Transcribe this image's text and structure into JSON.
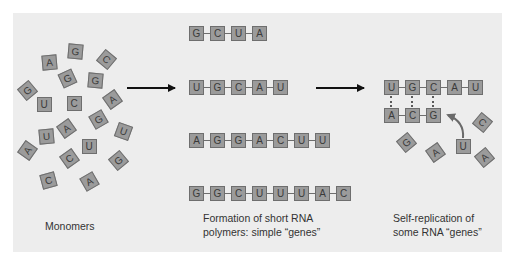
{
  "colors": {
    "panel_background": "#ededed",
    "tile_fill": "#9b9b9b",
    "tile_border": "#6e6e6e",
    "arrow": "#111111",
    "curved_arrow": "#6a6a6a",
    "caption_text": "#333333"
  },
  "sections": {
    "monomers": {
      "caption": "Monomers",
      "tiles": [
        {
          "letter": "A",
          "x": 49,
          "y": 62,
          "rot": -5
        },
        {
          "letter": "G",
          "x": 75,
          "y": 51,
          "rot": 5
        },
        {
          "letter": "C",
          "x": 106,
          "y": 59,
          "rot": 40
        },
        {
          "letter": "G",
          "x": 67,
          "y": 78,
          "rot": -25
        },
        {
          "letter": "G",
          "x": 95,
          "y": 80,
          "rot": 5
        },
        {
          "letter": "G",
          "x": 27,
          "y": 90,
          "rot": -40
        },
        {
          "letter": "U",
          "x": 44,
          "y": 104,
          "rot": 0
        },
        {
          "letter": "C",
          "x": 74,
          "y": 103,
          "rot": 0
        },
        {
          "letter": "A",
          "x": 112,
          "y": 99,
          "rot": -35
        },
        {
          "letter": "G",
          "x": 98,
          "y": 119,
          "rot": -30
        },
        {
          "letter": "U",
          "x": 46,
          "y": 136,
          "rot": -5
        },
        {
          "letter": "A",
          "x": 66,
          "y": 128,
          "rot": -35
        },
        {
          "letter": "U",
          "x": 123,
          "y": 131,
          "rot": 20
        },
        {
          "letter": "A",
          "x": 27,
          "y": 150,
          "rot": -55
        },
        {
          "letter": "U",
          "x": 89,
          "y": 146,
          "rot": 0
        },
        {
          "letter": "C",
          "x": 69,
          "y": 158,
          "rot": -35
        },
        {
          "letter": "G",
          "x": 118,
          "y": 160,
          "rot": -40
        },
        {
          "letter": "C",
          "x": 48,
          "y": 180,
          "rot": -15
        },
        {
          "letter": "A",
          "x": 89,
          "y": 181,
          "rot": -30
        }
      ]
    },
    "polymers": {
      "caption_line1": "Formation of short RNA",
      "caption_line2": "polymers: simple “genes”",
      "strands": [
        {
          "sequence": [
            "G",
            "C",
            "U",
            "A"
          ],
          "x": 189,
          "y": 26
        },
        {
          "sequence": [
            "U",
            "G",
            "C",
            "A",
            "U"
          ],
          "x": 189,
          "y": 80
        },
        {
          "sequence": [
            "A",
            "G",
            "G",
            "A",
            "C",
            "U",
            "U"
          ],
          "x": 189,
          "y": 133
        },
        {
          "sequence": [
            "G",
            "G",
            "C",
            "U",
            "U",
            "U",
            "A",
            "C"
          ],
          "x": 189,
          "y": 186
        }
      ]
    },
    "replication": {
      "caption_line1": "Self-replication of",
      "caption_line2": "some RNA “genes”",
      "template_strand": {
        "sequence": [
          "U",
          "G",
          "C",
          "A",
          "U"
        ],
        "x": 384,
        "y": 80
      },
      "complement_strand": {
        "sequence": [
          "A",
          "C",
          "G"
        ],
        "x": 384,
        "y": 108
      },
      "incoming_monomer": {
        "letter": "U",
        "x": 463,
        "y": 146,
        "rot": 0
      },
      "free_monomers": [
        {
          "letter": "G",
          "x": 406,
          "y": 142,
          "rot": -40
        },
        {
          "letter": "A",
          "x": 435,
          "y": 152,
          "rot": -35
        },
        {
          "letter": "C",
          "x": 482,
          "y": 122,
          "rot": 40
        },
        {
          "letter": "A",
          "x": 484,
          "y": 157,
          "rot": -40
        }
      ]
    }
  },
  "arrows": [
    {
      "from_x": 127,
      "to_x": 175,
      "y": 88
    },
    {
      "from_x": 316,
      "to_x": 364,
      "y": 88
    }
  ]
}
